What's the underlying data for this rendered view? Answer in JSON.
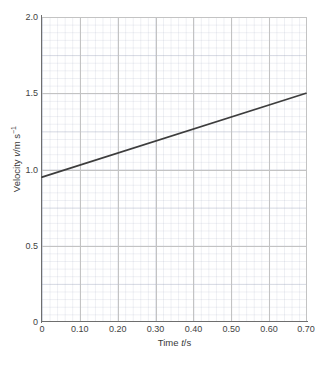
{
  "chart_data": {
    "type": "line",
    "title": "",
    "subtitle": "",
    "xlabel": "Time t/s",
    "ylabel": "Velocity v/m s⁻¹",
    "xlim": [
      0,
      0.7
    ],
    "ylim": [
      0,
      2.0
    ],
    "grid": true,
    "grid_style": "graph-paper (major + fine minor mesh)",
    "legend": "none",
    "x_ticks": [
      0,
      0.1,
      0.2,
      0.3,
      0.4,
      0.5,
      0.6,
      0.7
    ],
    "x_tick_labels": [
      "0",
      "0.10",
      "0.20",
      "0.30",
      "0.40",
      "0.50",
      "0.60",
      "0.70"
    ],
    "y_ticks": [
      0,
      0.5,
      1.0,
      1.5,
      2.0
    ],
    "y_tick_labels": [
      "0",
      "0.5",
      "1.0",
      "1.5",
      "2.0"
    ],
    "series": [
      {
        "name": "velocity",
        "color": "#3d3d3d",
        "line_width": 1.6,
        "x": [
          0,
          0.7
        ],
        "values": [
          0.95,
          1.5
        ],
        "points": [
          [
            0,
            0.95
          ],
          [
            0.7,
            1.5
          ]
        ],
        "relationship": "linear",
        "intercept": 0.95,
        "slope": 0.786
      }
    ]
  },
  "axes": {
    "x_label_prefix": "Time ",
    "x_label_symbol": "t",
    "x_label_suffix": "/s",
    "y_label_prefix": "Velocity ",
    "y_label_symbol": "v",
    "y_label_unit": "/m s",
    "y_label_exponent": "−1"
  },
  "colors": {
    "line": "#3d3d3d",
    "axis": "#6e6e6e",
    "major_grid": "#c3c3c3",
    "minor_grid": "#d8dce6",
    "background": "#ffffff",
    "text": "#3a3a3a"
  }
}
